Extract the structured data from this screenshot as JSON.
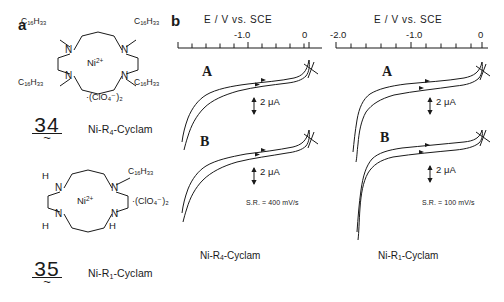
{
  "figure": {
    "panel_a_letter": "a",
    "panel_b_letter": "b"
  },
  "structures": [
    {
      "id": "ni-r4-cyclam",
      "number": "34",
      "name_html": "Ni-R<sub>4</sub>-Cyclam",
      "metal_center": "Ni",
      "metal_charge": "2+",
      "counter_ion": "·(ClO₄⁻)₂",
      "substituents": [
        "C16H33",
        "C16H33",
        "C16H33",
        "C16H33"
      ],
      "substituent_display": "C₁₆H₃₃",
      "nitrogen_label": "N"
    },
    {
      "id": "ni-r1-cyclam",
      "number": "35",
      "name_html": "Ni-R<sub>1</sub>-Cyclam",
      "metal_center": "Ni",
      "metal_charge": "2+",
      "counter_ion": "·(ClO₄⁻)₂",
      "substituents": [
        "H",
        "C16H33",
        "H",
        "H"
      ],
      "substituent_display": "C₁₆H₃₃",
      "hydrogen_label": "H",
      "nitrogen_label": "N"
    }
  ],
  "chart_data": [
    {
      "type": "line",
      "id": "cv-left",
      "title": "E / V vs. SCE",
      "xlabel": "E / V vs. SCE",
      "ylabel": "Current",
      "xlim": [
        -1.45,
        0.08
      ],
      "tick_labels": [
        "-1.0",
        "0"
      ],
      "tick_values": [
        -1.0,
        0.0
      ],
      "scan_rate": "S.R. = 400 mV/s",
      "caption_html": "Ni-R<sub>4</sub>-Cyclam",
      "scale_bar": "2 μA",
      "grid": false,
      "legend": "none",
      "series": [
        {
          "name": "A",
          "label": "A",
          "direction_markers": 2,
          "x": [
            0.0,
            -0.05,
            -0.16,
            -0.3,
            -0.45,
            -0.6,
            -0.75,
            -0.9,
            -1.02,
            -1.12,
            -1.22,
            -1.3,
            -1.38,
            -1.44
          ],
          "y_cathodic": [
            0.0,
            -0.06,
            -0.14,
            -0.22,
            -0.3,
            -0.37,
            -0.45,
            -0.56,
            -0.7,
            -0.88,
            -1.15,
            -1.5,
            -2.05,
            -2.7
          ],
          "y_anodic": [
            0.0,
            0.3,
            0.36,
            0.38,
            0.4,
            0.4,
            0.39,
            0.36,
            0.3,
            0.18,
            0.0,
            -0.3,
            -0.9,
            -1.9
          ]
        },
        {
          "name": "B",
          "label": "B",
          "direction_markers": 2,
          "x": [
            0.0,
            -0.05,
            -0.16,
            -0.3,
            -0.45,
            -0.6,
            -0.75,
            -0.9,
            -1.02,
            -1.12,
            -1.22,
            -1.3,
            -1.38,
            -1.44
          ],
          "y_cathodic": [
            0.0,
            -0.08,
            -0.16,
            -0.24,
            -0.31,
            -0.38,
            -0.47,
            -0.6,
            -0.78,
            -1.0,
            -1.35,
            -1.75,
            -2.3,
            -3.0
          ],
          "y_anodic": [
            0.0,
            0.32,
            0.4,
            0.44,
            0.47,
            0.48,
            0.47,
            0.44,
            0.37,
            0.24,
            0.05,
            -0.28,
            -0.95,
            -2.05
          ]
        }
      ]
    },
    {
      "type": "line",
      "id": "cv-right",
      "title": "E / V vs. SCE",
      "xlabel": "E / V vs. SCE",
      "ylabel": "Current",
      "xlim": [
        -2.12,
        0.08
      ],
      "tick_labels": [
        "-2.0",
        "-1.0",
        "0"
      ],
      "tick_values": [
        -2.0,
        -1.0,
        0.0
      ],
      "scan_rate": "S.R. = 100 mV/s",
      "caption_html": "Ni-R<sub>1</sub>-Cyclam",
      "scale_bar": "2 μA",
      "grid": false,
      "legend": "none",
      "series": [
        {
          "name": "A",
          "label": "A",
          "direction_markers": 2,
          "x": [
            0.0,
            -0.1,
            -0.3,
            -0.6,
            -0.9,
            -1.2,
            -1.45,
            -1.62,
            -1.72,
            -1.8,
            -1.86,
            -1.92,
            -1.98,
            -2.04
          ],
          "y_cathodic": [
            0.0,
            -0.08,
            -0.16,
            -0.24,
            -0.33,
            -0.45,
            -0.62,
            -0.85,
            -1.15,
            -1.6,
            -2.15,
            -2.75,
            -3.3,
            -3.8
          ],
          "y_anodic": [
            0.0,
            0.34,
            0.42,
            0.45,
            0.45,
            0.43,
            0.36,
            0.2,
            -0.1,
            -0.6,
            -1.35,
            -2.15,
            -2.95,
            -3.65
          ]
        },
        {
          "name": "B",
          "label": "B",
          "direction_markers": 2,
          "x": [
            0.0,
            -0.1,
            -0.3,
            -0.6,
            -0.9,
            -1.2,
            -1.45,
            -1.62,
            -1.72,
            -1.8,
            -1.86,
            -1.92,
            -1.98,
            -2.04
          ],
          "y_cathodic": [
            0.0,
            -0.1,
            -0.18,
            -0.24,
            -0.3,
            -0.38,
            -0.52,
            -0.75,
            -1.1,
            -1.6,
            -2.25,
            -2.95,
            -3.6,
            -4.2
          ],
          "y_anodic": [
            0.0,
            0.2,
            0.26,
            0.28,
            0.28,
            0.26,
            0.18,
            0.02,
            -0.28,
            -0.8,
            -1.55,
            -2.4,
            -3.25,
            -4.05
          ]
        }
      ]
    }
  ]
}
